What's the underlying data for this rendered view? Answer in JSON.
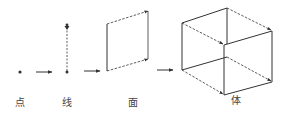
{
  "diagram": {
    "title": "",
    "stages": [
      {
        "id": "point",
        "label": "点",
        "x": 20
      },
      {
        "id": "line",
        "label": "线",
        "x": 67
      },
      {
        "id": "plane",
        "label": "面",
        "x": 133
      },
      {
        "id": "solid",
        "label": "体",
        "x": 236
      }
    ],
    "colors": {
      "stroke": "#333333",
      "label": "#444444",
      "background": "#ffffff"
    }
  }
}
